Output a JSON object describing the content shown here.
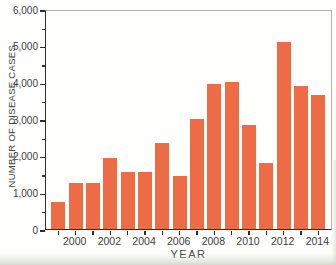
{
  "chart_data": {
    "type": "bar",
    "title": "",
    "xlabel": "YEAR",
    "ylabel": "NUMBER OF DISEASE CASES",
    "categories": [
      1999,
      2000,
      2001,
      2002,
      2003,
      2004,
      2005,
      2006,
      2007,
      2008,
      2009,
      2010,
      2011,
      2012,
      2013,
      2014
    ],
    "values": [
      750,
      1250,
      1250,
      1950,
      1550,
      1550,
      2350,
      1450,
      3000,
      3950,
      4000,
      2850,
      1800,
      5100,
      3900,
      3650
    ],
    "ylim": [
      0,
      6000
    ],
    "ytick_interval": 1000,
    "ytick_minor_interval": 500,
    "ytick_labels": [
      "0",
      "1,000",
      "2,000",
      "3,000",
      "4,000",
      "5,000",
      "6,000"
    ],
    "xtick_label_years": [
      "2000",
      "2002",
      "2004",
      "2006",
      "2008",
      "2010",
      "2012",
      "2014"
    ],
    "grid": false,
    "legend": false,
    "colors": {
      "bar": "#ee6c45",
      "axis": "#2e2e2e",
      "text": "#3d3d3d",
      "frame": "#b5b2ac",
      "page_edge": "#d0d5c4"
    }
  }
}
